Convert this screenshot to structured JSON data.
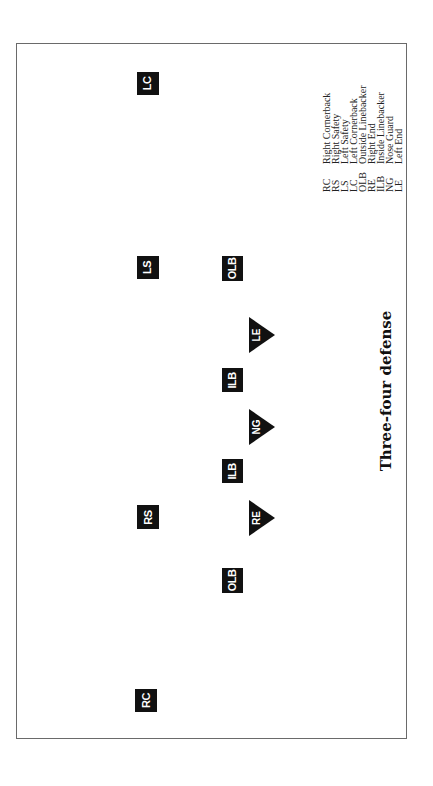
{
  "diagram": {
    "title": "Three-four defense",
    "orientation": "rotated 90 degrees counter-clockwise",
    "colors": {
      "marker_fill": "#111111",
      "marker_text": "#ffffff",
      "frame": "#6a6a6a",
      "background": "#ffffff"
    },
    "players": {
      "lc": {
        "label": "LC",
        "shape": "square",
        "role": "Left Cornerback"
      },
      "ls": {
        "label": "LS",
        "shape": "square",
        "role": "Left Safety"
      },
      "rs": {
        "label": "RS",
        "shape": "square",
        "role": "Right Safety"
      },
      "rc": {
        "label": "RC",
        "shape": "square",
        "role": "Right Cornerback"
      },
      "olb_left": {
        "label": "OLB",
        "shape": "square",
        "role": "Outside Linebacker"
      },
      "ilb_left": {
        "label": "ILB",
        "shape": "square",
        "role": "Inside Linebacker"
      },
      "ilb_right": {
        "label": "ILB",
        "shape": "square",
        "role": "Inside Linebacker"
      },
      "olb_right": {
        "label": "OLB",
        "shape": "square",
        "role": "Outside Linebacker"
      },
      "le": {
        "label": "LE",
        "shape": "triangle",
        "role": "Left End"
      },
      "ng": {
        "label": "NG",
        "shape": "triangle",
        "role": "Nose Guard"
      },
      "re": {
        "label": "RE",
        "shape": "triangle",
        "role": "Right End"
      }
    },
    "legend": [
      {
        "abbr": "RC",
        "desc": "Right Cornerback"
      },
      {
        "abbr": "RS",
        "desc": "Right Safety"
      },
      {
        "abbr": "LS",
        "desc": "Left Safety"
      },
      {
        "abbr": "LC",
        "desc": "Left Cornerback"
      },
      {
        "abbr": "OLB",
        "desc": "Outside Linebacker"
      },
      {
        "abbr": "RE",
        "desc": "Right End"
      },
      {
        "abbr": "ILB",
        "desc": "Inside Linebacker"
      },
      {
        "abbr": "NG",
        "desc": "Nose Guard"
      },
      {
        "abbr": "LE",
        "desc": "Left End"
      }
    ]
  }
}
